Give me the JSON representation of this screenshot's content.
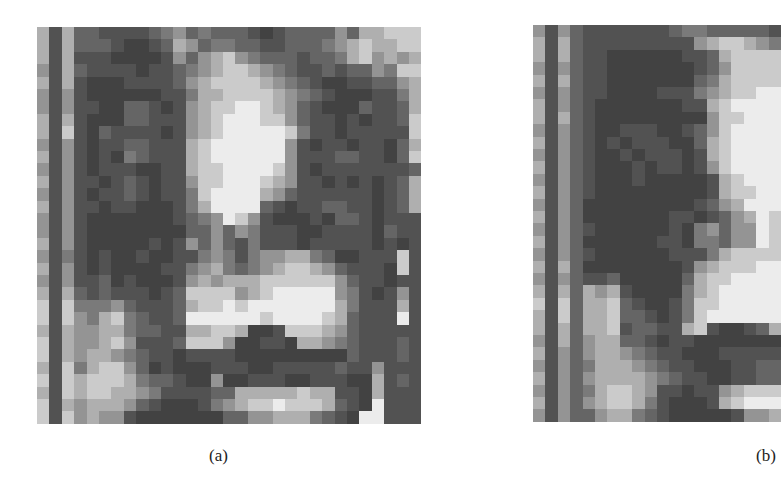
{
  "figure": {
    "panels": [
      {
        "id": "a",
        "caption": "(a)",
        "description": "Pixelated grayscale portrait (low-resolution face image)",
        "origin": [
          37,
          27
        ],
        "cell": 12.4,
        "clip": [
          385,
          397
        ],
        "palette": {
          "0": "#2a2a2a",
          "1": "#353535",
          "2": "#424242",
          "3": "#525252",
          "4": "#656565",
          "5": "#7a7a7a",
          "6": "#949494",
          "7": "#afafaf",
          "8": "#cbcbcb",
          "9": "#ececec",
          "w": "#ffffff"
        },
        "rows": [
          "7374433334564544432344446477888ww",
          "7374443223476455443344456787788ww",
          "7373332222364678654443445786767ww",
          "6374333323345678876543343446588ww",
          "7373222333346788887654322334467ww",
          "6363222222335778888765432223357ww",
          "6363322443236788998764322243347ww",
          "7373222443336789998864332323348ww",
          "7383243333236789999985332333338ww",
          "6363233443337899999963233233247ww",
          "7363232543337899999963334433248ww",
          "6363233322337889999863233333334ww",
          "7363323432336889998763323232347ww",
          "6363233432335899997643333332347ww",
          "7363323322235799994323344332347ww",
          "6363222222234569863222324432333",
          "6363222222224464653332233332433",
          "7363222223236464353332333332323",
          "6353232232233565356677542233383",
          "7363232222335675456788764333283",
          "6363342322236767778888886433233",
          "7374343332348888678999996532363",
          "8385556433347889899999997533373",
          "8386578543349999998999987433393",
          "7376677544337788722388876433333",
          "8376678633348886223327765433343",
          "8376776543323333222222222433343",
          "7385788642322233322333334336333",
          "8387888754432262233322333227343",
          "7387887765333344777778773327333",
          "8376777643222356788988874329333",
          "8386766322222224466777543299333",
          "8372222222222222222222223w93333"
        ]
      },
      {
        "id": "b",
        "caption": "(b)",
        "description": "Pixelated grayscale portrait, alternate rendering (partially cropped at right edge)",
        "origin": [
          533,
          25
        ],
        "cell": 12.4,
        "clip": [
          251,
          397
        ],
        "palette": {
          "0": "#2a2a2a",
          "1": "#353535",
          "2": "#424242",
          "3": "#525252",
          "4": "#656565",
          "5": "#7a7a7a",
          "6": "#949494",
          "7": "#afafaf",
          "8": "#cbcbcb",
          "9": "#ececec",
          "w": "#ffffff"
        },
        "rows": [
          "63643333333455444443",
          "73743333333336788765",
          "73743322222233478888",
          "63643322222223468888",
          "73743322222224578888",
          "63643322223335678899",
          "73643222222233789999",
          "73743222222222688999",
          "63643223332234689999",
          "73643232333224789999",
          "63643223233323789999",
          "73643222323323689999",
          "63643222322222378999",
          "73643222222222378899",
          "63642222222223467999",
          "73642222222332346798",
          "63643222222325646698",
          "73642222223325546698",
          "63643222222333578888",
          "73742222222236788899",
          "63643342222247889999",
          "73747673222257899999",
          "83847784322358899999",
          "73847784432358999999",
          "73747783443378322347",
          "63746774432332222222",
          "73646776543322233333",
          "63645777654332223344",
          "73646777765433223344",
          "63645788763323367888",
          "73646788753222378999",
          "63644677543222223667",
          "8882222222222222222"
        ]
      }
    ]
  }
}
